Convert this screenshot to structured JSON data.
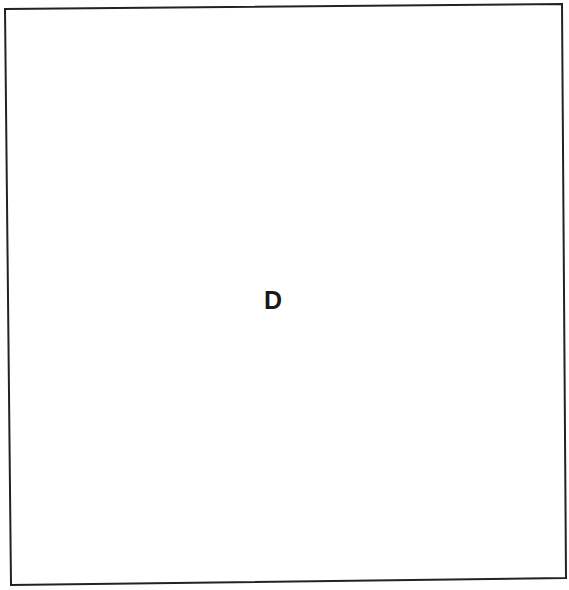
{
  "figure": {
    "panel": {
      "label": "D",
      "border_color": "#222222",
      "background": "#ffffff",
      "corners": {
        "top_left": [
          5,
          9
        ],
        "top_right": [
          562,
          4
        ],
        "bottom_right": [
          566,
          578
        ],
        "bottom_left": [
          11,
          585
        ]
      }
    }
  }
}
